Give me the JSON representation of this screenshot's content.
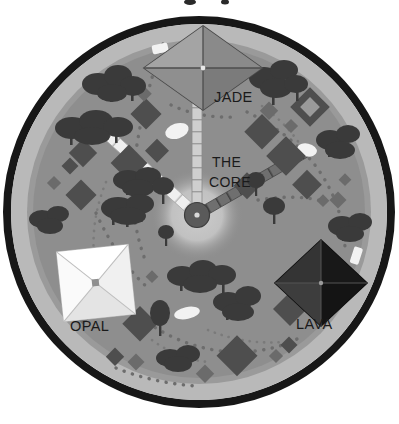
{
  "map": {
    "name": "circular-island-map",
    "labels": {
      "core": {
        "line1": "THE",
        "line2": "CORE"
      },
      "jade": "JADE",
      "lava": "LAVA",
      "opal": "OPAL"
    },
    "colors": {
      "page_background": "#ffffff",
      "outer_rim": "#171717",
      "outer_band": "#b9b9b9",
      "inner_band": "#9a9a9a",
      "terrain": "#8e8e8e",
      "core_glow": "#bdbdbd",
      "core_glow_inner": "#c9c9c9",
      "hub": "#5a5a5a",
      "hub_center": "#d8d8d8",
      "road_jade": "#cfcfcf",
      "road_opal": "#efefef",
      "road_lava": "#6f6f6f",
      "plot_dark": "#4e4e4e",
      "plot_mid": "#6b6b6b",
      "tree": "#3a3a3a",
      "pond": "#f2f2f2",
      "pyramid_jade_light": "#a2a2a2",
      "pyramid_jade_dark": "#7b7b7b",
      "pyramid_lava_light": "#3b3b3b",
      "pyramid_lava_dark": "#161616",
      "pyramid_opal_light": "#ffffff",
      "pyramid_opal_dark": "#e4e4e4",
      "label_text": "#1a1a1a",
      "path_dots": "#6d6d6d"
    },
    "geometry": {
      "center_x": 199,
      "center_y": 212,
      "rim_radius": 196,
      "rim_width": 7,
      "outer_band_radius": 188,
      "inner_band_radius": 172,
      "core_glow_radius": 42,
      "hub_radius": 11
    },
    "sites": [
      {
        "id": "jade",
        "label": "JADE",
        "shape": "diamond-pyramid",
        "x": 203,
        "y": 67,
        "label_x": 214,
        "label_y": 101
      },
      {
        "id": "lava",
        "label": "LAVA",
        "shape": "diamond-pyramid",
        "x": 321,
        "y": 283,
        "label_x": 297,
        "label_y": 328
      },
      {
        "id": "opal",
        "label": "OPAL",
        "shape": "square-pyramid",
        "x": 96,
        "y": 283,
        "label_x": 71,
        "label_y": 331
      }
    ],
    "roads": [
      {
        "id": "road-core-jade",
        "from": "core",
        "to": "jade",
        "style": "light-rungs"
      },
      {
        "id": "road-core-opal",
        "from": "core",
        "to": "opal",
        "style": "white-rungs"
      },
      {
        "id": "road-core-lava",
        "from": "core",
        "to": "lava",
        "style": "dark-rungs"
      }
    ],
    "plots": [
      {
        "x": 129,
        "y": 163,
        "s": 17,
        "tone": "dark"
      },
      {
        "x": 146,
        "y": 114,
        "s": 15,
        "tone": "dark"
      },
      {
        "x": 83,
        "y": 153,
        "s": 13,
        "tone": "dark"
      },
      {
        "x": 70,
        "y": 166,
        "s": 9,
        "tone": "dark"
      },
      {
        "x": 54,
        "y": 183,
        "s": 7,
        "tone": "dark"
      },
      {
        "x": 80,
        "y": 194,
        "s": 16,
        "tone": "dark"
      },
      {
        "x": 144,
        "y": 93,
        "s": 8,
        "tone": "mid"
      },
      {
        "x": 157,
        "y": 150,
        "s": 12,
        "tone": "dark"
      },
      {
        "x": 262,
        "y": 131,
        "s": 17,
        "tone": "dark"
      },
      {
        "x": 286,
        "y": 156,
        "s": 19,
        "tone": "dark"
      },
      {
        "x": 308,
        "y": 185,
        "s": 14,
        "tone": "dark"
      },
      {
        "x": 337,
        "y": 200,
        "s": 9,
        "tone": "mid"
      },
      {
        "x": 345,
        "y": 179,
        "s": 7,
        "tone": "mid"
      },
      {
        "x": 247,
        "y": 185,
        "s": 13,
        "tone": "dark"
      },
      {
        "x": 269,
        "y": 110,
        "s": 10,
        "tone": "mid"
      },
      {
        "x": 310,
        "y": 107,
        "s": 16,
        "tone": "frame"
      },
      {
        "x": 140,
        "y": 323,
        "s": 17,
        "tone": "dark"
      },
      {
        "x": 136,
        "y": 362,
        "s": 9,
        "tone": "mid"
      },
      {
        "x": 115,
        "y": 356,
        "s": 9,
        "tone": "dark"
      },
      {
        "x": 205,
        "y": 373,
        "s": 9,
        "tone": "mid"
      },
      {
        "x": 237,
        "y": 355,
        "s": 20,
        "tone": "dark"
      },
      {
        "x": 276,
        "y": 356,
        "s": 7,
        "tone": "mid"
      },
      {
        "x": 288,
        "y": 345,
        "s": 8,
        "tone": "dark"
      },
      {
        "x": 290,
        "y": 309,
        "s": 16,
        "tone": "dark"
      },
      {
        "x": 83,
        "y": 316,
        "s": 8,
        "tone": "mid"
      },
      {
        "x": 152,
        "y": 276,
        "s": 6,
        "tone": "mid"
      }
    ],
    "tree_clusters": [
      {
        "x": 105,
        "y": 80,
        "w": 54,
        "h": 30
      },
      {
        "x": 83,
        "y": 125,
        "w": 66,
        "h": 26
      },
      {
        "x": 135,
        "y": 175,
        "w": 42,
        "h": 22
      },
      {
        "x": 125,
        "y": 205,
        "w": 46,
        "h": 24
      },
      {
        "x": 45,
        "y": 218,
        "w": 30,
        "h": 20
      },
      {
        "x": 268,
        "y": 73,
        "w": 46,
        "h": 28
      },
      {
        "x": 337,
        "y": 140,
        "w": 38,
        "h": 26
      },
      {
        "x": 349,
        "y": 228,
        "w": 36,
        "h": 22
      },
      {
        "x": 195,
        "y": 272,
        "w": 62,
        "h": 24
      },
      {
        "x": 236,
        "y": 298,
        "w": 48,
        "h": 24
      },
      {
        "x": 176,
        "y": 357,
        "w": 38,
        "h": 20
      },
      {
        "x": 160,
        "y": 192,
        "w": 20,
        "h": 20
      },
      {
        "x": 257,
        "y": 180,
        "w": 18,
        "h": 18
      },
      {
        "x": 275,
        "y": 207,
        "w": 22,
        "h": 20
      },
      {
        "x": 161,
        "y": 312,
        "w": 18,
        "h": 24
      },
      {
        "x": 164,
        "y": 349,
        "w": 16,
        "h": 18
      }
    ],
    "ponds": [
      {
        "x": 177,
        "y": 131,
        "rx": 11,
        "ry": 7
      },
      {
        "x": 306,
        "y": 150,
        "rx": 10,
        "ry": 7
      },
      {
        "x": 187,
        "y": 313,
        "rx": 13,
        "ry": 6
      },
      {
        "x": 160,
        "y": 50,
        "rx": 8,
        "ry": 4
      }
    ]
  }
}
